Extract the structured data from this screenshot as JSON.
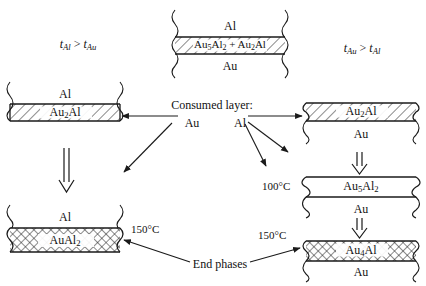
{
  "diagram": {
    "type": "process-flow-cross-section",
    "conditions": {
      "left": "t Al > t Au",
      "left_parts": {
        "a_sym": "t",
        "a_sub": "Al",
        "rel": ">",
        "b_sym": "t",
        "b_sub": "Au"
      },
      "right": "t Au > t Al",
      "right_parts": {
        "a_sym": "t",
        "a_sub": "Au",
        "rel": ">",
        "b_sym": "t",
        "b_sub": "Al"
      }
    },
    "center_heading": "Consumed layer:",
    "consumed": {
      "left": "Au",
      "right": "Al"
    },
    "end_phases_label": "End phases",
    "stacks": {
      "top": {
        "name": "initial-stack",
        "layers": [
          {
            "label": "Al",
            "sub": "",
            "fill": "plain"
          },
          {
            "label_full": "Au5Al2 + Au2Al",
            "fill": "hatch"
          },
          {
            "label": "Au",
            "sub": "",
            "fill": "plain"
          }
        ]
      },
      "left_upper": {
        "name": "al-rich-intermediate",
        "layers": [
          {
            "label": "Al",
            "fill": "plain"
          },
          {
            "label_full": "Au2Al",
            "fill": "hatch"
          }
        ]
      },
      "left_lower": {
        "name": "al-rich-end-phase",
        "temperature": "150°C",
        "layers": [
          {
            "label": "Al",
            "fill": "plain"
          },
          {
            "label_full": "AuAl2",
            "fill": "cross"
          }
        ]
      },
      "right_upper": {
        "name": "au-rich-intermediate",
        "layers": [
          {
            "label_full": "Au2Al",
            "fill": "hatch"
          },
          {
            "label": "Au",
            "fill": "plain"
          }
        ]
      },
      "right_middle": {
        "name": "au-rich-100c",
        "temperature": "100°C",
        "layers": [
          {
            "label_full": "Au5Al2",
            "fill": "plain"
          },
          {
            "label": "Au",
            "fill": "plain"
          }
        ]
      },
      "right_lower": {
        "name": "au-rich-end-phase",
        "temperature": "150°C",
        "layers": [
          {
            "label_full": "Au4Al",
            "fill": "cross"
          },
          {
            "label": "Au",
            "fill": "plain"
          }
        ]
      }
    },
    "phase_labels": {
      "al": "Al",
      "au": "Au",
      "au5al2_plus_au2al_a": "Au",
      "au2al": "Au",
      "aual2": "Au",
      "au4al": "Au",
      "au5al2": "Au"
    },
    "temperatures": {
      "t100": "100°C",
      "t150_left": "150°C",
      "t150_right": "150°C"
    },
    "colors": {
      "line": "#1a1a1a",
      "background": "#ffffff",
      "hatch": "#333333"
    }
  }
}
